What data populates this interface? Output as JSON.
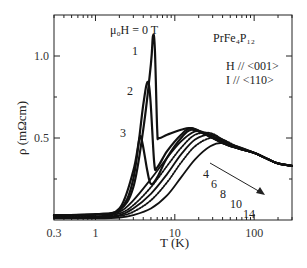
{
  "chart_data": {
    "type": "line",
    "title": "",
    "xlabel": "T (K)",
    "ylabel": "ρ (mΩcm)",
    "xscale": "log",
    "xlim": [
      0.3,
      300
    ],
    "ylim": [
      0,
      1.25
    ],
    "xticks": [
      {
        "value": 0.3,
        "label": "0.3"
      },
      {
        "value": 1,
        "label": "1"
      },
      {
        "value": 10,
        "label": "10"
      },
      {
        "value": 100,
        "label": "100"
      }
    ],
    "yticks": [
      {
        "value": 0.5,
        "label": "0.5"
      },
      {
        "value": 1.0,
        "label": "1.0"
      }
    ],
    "annotations": {
      "field_label": "μ₀H = 0 T",
      "compound": "PrFe₄P₁₂",
      "orientation_h": "H // <001>",
      "orientation_i": "I  // <110>",
      "curve_labels_zero_field": [
        "1",
        "2",
        "3"
      ],
      "field_values": [
        "4",
        "6",
        "8",
        "10",
        "14"
      ],
      "arrow": "increasing field direction"
    },
    "series": [
      {
        "name": "0 T (1)",
        "style": "solid",
        "points": [
          [
            0.3,
            0.03
          ],
          [
            1,
            0.035
          ],
          [
            2,
            0.06
          ],
          [
            3,
            0.2
          ],
          [
            4,
            0.55
          ],
          [
            5,
            0.95
          ],
          [
            5.3,
            1.12
          ],
          [
            5.6,
            1.05
          ],
          [
            6,
            0.55
          ],
          [
            6.3,
            0.5
          ],
          [
            8,
            0.52
          ],
          [
            12,
            0.55
          ],
          [
            16,
            0.56
          ],
          [
            25,
            0.52
          ],
          [
            40,
            0.47
          ],
          [
            60,
            0.44
          ],
          [
            100,
            0.41
          ],
          [
            150,
            0.37
          ],
          [
            200,
            0.345
          ],
          [
            300,
            0.33
          ]
        ]
      },
      {
        "name": "0 T (2)",
        "style": "solid",
        "points": [
          [
            0.3,
            0.03
          ],
          [
            1,
            0.035
          ],
          [
            2,
            0.06
          ],
          [
            3,
            0.25
          ],
          [
            4,
            0.7
          ],
          [
            4.5,
            0.84
          ],
          [
            4.9,
            0.75
          ],
          [
            5.5,
            0.35
          ],
          [
            6,
            0.32
          ],
          [
            8,
            0.42
          ],
          [
            12,
            0.52
          ],
          [
            16,
            0.56
          ],
          [
            25,
            0.52
          ],
          [
            40,
            0.47
          ],
          [
            60,
            0.44
          ],
          [
            100,
            0.41
          ],
          [
            150,
            0.37
          ],
          [
            200,
            0.345
          ],
          [
            300,
            0.33
          ]
        ]
      },
      {
        "name": "0 T (3)",
        "style": "solid",
        "points": [
          [
            0.3,
            0.03
          ],
          [
            1,
            0.035
          ],
          [
            2,
            0.07
          ],
          [
            3,
            0.3
          ],
          [
            3.6,
            0.5
          ],
          [
            3.9,
            0.47
          ],
          [
            4.5,
            0.3
          ],
          [
            5,
            0.22
          ],
          [
            6,
            0.26
          ],
          [
            8,
            0.38
          ],
          [
            12,
            0.5
          ],
          [
            16,
            0.55
          ],
          [
            25,
            0.52
          ],
          [
            40,
            0.47
          ],
          [
            60,
            0.44
          ],
          [
            100,
            0.41
          ],
          [
            150,
            0.37
          ],
          [
            200,
            0.345
          ],
          [
            300,
            0.33
          ]
        ]
      },
      {
        "name": "4 T",
        "style": "solid",
        "points": [
          [
            0.3,
            0.02
          ],
          [
            1,
            0.02
          ],
          [
            2,
            0.05
          ],
          [
            3,
            0.12
          ],
          [
            5,
            0.25
          ],
          [
            8,
            0.38
          ],
          [
            12,
            0.48
          ],
          [
            18,
            0.54
          ],
          [
            25,
            0.53
          ],
          [
            40,
            0.48
          ],
          [
            60,
            0.44
          ],
          [
            100,
            0.41
          ],
          [
            150,
            0.37
          ],
          [
            200,
            0.345
          ],
          [
            300,
            0.33
          ]
        ]
      },
      {
        "name": "6 T",
        "style": "dotted",
        "points": [
          [
            0.3,
            0.02
          ],
          [
            1,
            0.02
          ],
          [
            2,
            0.04
          ],
          [
            3,
            0.09
          ],
          [
            5,
            0.2
          ],
          [
            8,
            0.33
          ],
          [
            12,
            0.44
          ],
          [
            18,
            0.52
          ],
          [
            28,
            0.53
          ],
          [
            40,
            0.49
          ],
          [
            60,
            0.44
          ],
          [
            100,
            0.41
          ],
          [
            150,
            0.37
          ],
          [
            200,
            0.345
          ],
          [
            300,
            0.33
          ]
        ]
      },
      {
        "name": "8 T",
        "style": "solid",
        "points": [
          [
            0.3,
            0.015
          ],
          [
            1,
            0.015
          ],
          [
            2,
            0.03
          ],
          [
            3,
            0.07
          ],
          [
            5,
            0.16
          ],
          [
            8,
            0.28
          ],
          [
            12,
            0.4
          ],
          [
            18,
            0.49
          ],
          [
            28,
            0.52
          ],
          [
            40,
            0.49
          ],
          [
            60,
            0.44
          ],
          [
            100,
            0.41
          ],
          [
            150,
            0.37
          ],
          [
            200,
            0.345
          ],
          [
            300,
            0.33
          ]
        ]
      },
      {
        "name": "10 T",
        "style": "dotted",
        "points": [
          [
            0.3,
            0.015
          ],
          [
            1,
            0.015
          ],
          [
            2,
            0.025
          ],
          [
            3,
            0.05
          ],
          [
            5,
            0.12
          ],
          [
            8,
            0.23
          ],
          [
            12,
            0.35
          ],
          [
            18,
            0.45
          ],
          [
            28,
            0.5
          ],
          [
            40,
            0.49
          ],
          [
            60,
            0.45
          ],
          [
            100,
            0.41
          ],
          [
            150,
            0.37
          ],
          [
            200,
            0.345
          ],
          [
            300,
            0.33
          ]
        ]
      },
      {
        "name": "14 T",
        "style": "solid",
        "points": [
          [
            0.3,
            0.01
          ],
          [
            1,
            0.01
          ],
          [
            2,
            0.015
          ],
          [
            3,
            0.03
          ],
          [
            5,
            0.07
          ],
          [
            8,
            0.15
          ],
          [
            12,
            0.26
          ],
          [
            18,
            0.37
          ],
          [
            28,
            0.45
          ],
          [
            40,
            0.47
          ],
          [
            60,
            0.45
          ],
          [
            100,
            0.41
          ],
          [
            150,
            0.37
          ],
          [
            200,
            0.345
          ],
          [
            300,
            0.33
          ]
        ]
      }
    ]
  }
}
